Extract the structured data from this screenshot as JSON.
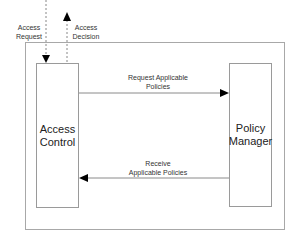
{
  "diagram": {
    "external_flows": {
      "access_request": {
        "line1": "Access",
        "line2": "Request"
      },
      "access_decision": {
        "line1": "Access",
        "line2": "Decision"
      }
    },
    "nodes": {
      "access_control": {
        "line1": "Access",
        "line2": "Control"
      },
      "policy_manager": {
        "line1": "Policy",
        "line2": "Manager"
      }
    },
    "edges": {
      "request_policies": {
        "line1": "Request Applicable",
        "line2": "Policies"
      },
      "receive_policies": {
        "line1": "Receive",
        "line2": "Applicable Policies"
      }
    },
    "colors": {
      "frame": "#a8a8a8",
      "box": "#9a9a9a",
      "arrow": "#000000",
      "line": "#8a8a8a"
    }
  }
}
